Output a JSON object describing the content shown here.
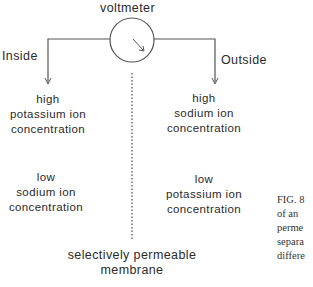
{
  "diagram": {
    "voltmeter_label": "voltmeter",
    "inside_label": "Inside",
    "outside_label": "Outside",
    "inside_top": [
      "high",
      "potassium ion",
      "concentration"
    ],
    "outside_top": [
      "high",
      "sodium ion",
      "concentration"
    ],
    "inside_bottom": [
      "low",
      "sodium ion",
      "concentration"
    ],
    "outside_bottom": [
      "low",
      "potassium ion",
      "concentration"
    ],
    "membrane_label": [
      "selectively permeable",
      "membrane"
    ],
    "caption_fragment": [
      "FIG. 8",
      "of an",
      "perme",
      "separa",
      "differe"
    ],
    "line_color": "#555555",
    "text_color": "#2a2a2a"
  }
}
